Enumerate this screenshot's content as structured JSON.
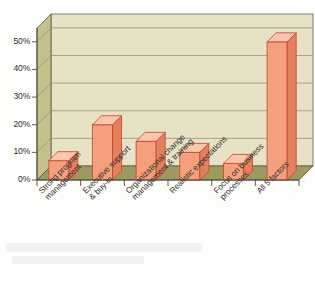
{
  "chart_data": {
    "type": "bar",
    "title": "",
    "subtitle": "",
    "xlabel": "",
    "ylabel": "",
    "categories": [
      "Strong program\nmanagement",
      "Executive support\n& buy-in",
      "Organizational change\nmanagement & training",
      "Realistic expectations",
      "Focus on business\nprocesses",
      "All 5 factors"
    ],
    "values": [
      7,
      20,
      14,
      10,
      6,
      50
    ],
    "ylim": [
      0,
      55
    ],
    "ytick_values": [
      0,
      10,
      20,
      30,
      40,
      50
    ],
    "ytick_labels": [
      "0%",
      "10%",
      "20%",
      "30%",
      "40%",
      "50%"
    ],
    "grid": true,
    "grid_axis": "y",
    "legend": false,
    "legend_position": "none",
    "style": "3d-column",
    "colors": {
      "bar_front": "#F4A07C",
      "bar_side": "#E4805E",
      "bar_top": "#FAC6AC",
      "bar_outline": "#C4432B",
      "plot_background": "#E7E2C6",
      "wall_left": "#C8C08C",
      "floor": "#9C9A5E",
      "gridline": "#8E8A63",
      "axis_line": "#4A4A42",
      "text": "#2b2b2b",
      "page_background": "#fdfdfb"
    }
  }
}
